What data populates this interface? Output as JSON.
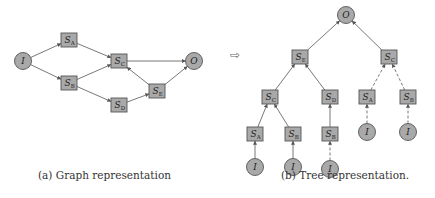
{
  "graph": {
    "caption": "(a) Graph representation",
    "nodes": [
      {
        "id": "I",
        "shape": "circle",
        "label": "I",
        "sub": "",
        "x": 23,
        "y": 61
      },
      {
        "id": "SA",
        "shape": "box",
        "label": "S",
        "sub": "A",
        "x": 69,
        "y": 40
      },
      {
        "id": "SB",
        "shape": "box",
        "label": "S",
        "sub": "B",
        "x": 69,
        "y": 83
      },
      {
        "id": "SC",
        "shape": "box",
        "label": "S",
        "sub": "C",
        "x": 119,
        "y": 61
      },
      {
        "id": "SD",
        "shape": "box",
        "label": "S",
        "sub": "D",
        "x": 119,
        "y": 105
      },
      {
        "id": "SE",
        "shape": "box",
        "label": "S",
        "sub": "E",
        "x": 157,
        "y": 91
      },
      {
        "id": "O",
        "shape": "circle",
        "label": "O",
        "sub": "",
        "x": 194,
        "y": 61
      }
    ],
    "edges": [
      {
        "from": "I",
        "to": "SA",
        "style": "solid"
      },
      {
        "from": "I",
        "to": "SB",
        "style": "solid"
      },
      {
        "from": "SA",
        "to": "SC",
        "style": "solid"
      },
      {
        "from": "SB",
        "to": "SC",
        "style": "solid"
      },
      {
        "from": "SB",
        "to": "SD",
        "style": "solid"
      },
      {
        "from": "SC",
        "to": "O",
        "style": "solid"
      },
      {
        "from": "SE",
        "to": "SC",
        "style": "solid"
      },
      {
        "from": "SD",
        "to": "SE",
        "style": "solid"
      },
      {
        "from": "SE",
        "to": "O",
        "style": "solid"
      }
    ]
  },
  "transform_arrow": "⇨",
  "tree": {
    "caption": "(b) Tree representation.",
    "nodes": [
      {
        "id": "t_O",
        "shape": "circle",
        "label": "O",
        "sub": "",
        "x": 346,
        "y": 15
      },
      {
        "id": "t_SE",
        "shape": "box",
        "label": "S",
        "sub": "E",
        "x": 300,
        "y": 57
      },
      {
        "id": "t_SC",
        "shape": "box",
        "label": "S",
        "sub": "C",
        "x": 389,
        "y": 57
      },
      {
        "id": "t_SC2",
        "shape": "box",
        "label": "S",
        "sub": "C",
        "x": 270,
        "y": 97
      },
      {
        "id": "t_SD",
        "shape": "box",
        "label": "S",
        "sub": "D",
        "x": 330,
        "y": 97
      },
      {
        "id": "t_SA2",
        "shape": "box",
        "label": "S",
        "sub": "A",
        "x": 367,
        "y": 97
      },
      {
        "id": "t_SB2",
        "shape": "box",
        "label": "S",
        "sub": "B",
        "x": 408,
        "y": 97
      },
      {
        "id": "t_SA3",
        "shape": "box",
        "label": "S",
        "sub": "A",
        "x": 255,
        "y": 134
      },
      {
        "id": "t_SB3",
        "shape": "box",
        "label": "S",
        "sub": "B",
        "x": 293,
        "y": 134
      },
      {
        "id": "t_SB4",
        "shape": "box",
        "label": "S",
        "sub": "B",
        "x": 330,
        "y": 134
      },
      {
        "id": "t_I1",
        "shape": "circle",
        "label": "I",
        "sub": "",
        "x": 255,
        "y": 167
      },
      {
        "id": "t_I2",
        "shape": "circle",
        "label": "I",
        "sub": "",
        "x": 293,
        "y": 167
      },
      {
        "id": "t_I3",
        "shape": "circle",
        "label": "I",
        "sub": "",
        "x": 330,
        "y": 169
      },
      {
        "id": "t_I4",
        "shape": "circle",
        "label": "I",
        "sub": "",
        "x": 367,
        "y": 132
      },
      {
        "id": "t_I5",
        "shape": "circle",
        "label": "I",
        "sub": "",
        "x": 408,
        "y": 132
      }
    ],
    "edges": [
      {
        "from": "t_SE",
        "to": "t_O",
        "style": "solid"
      },
      {
        "from": "t_SC",
        "to": "t_O",
        "style": "solid"
      },
      {
        "from": "t_SC2",
        "to": "t_SE",
        "style": "solid"
      },
      {
        "from": "t_SD",
        "to": "t_SE",
        "style": "solid"
      },
      {
        "from": "t_SA2",
        "to": "t_SC",
        "style": "dashed"
      },
      {
        "from": "t_SB2",
        "to": "t_SC",
        "style": "dashed"
      },
      {
        "from": "t_SA3",
        "to": "t_SC2",
        "style": "solid"
      },
      {
        "from": "t_SB3",
        "to": "t_SC2",
        "style": "solid"
      },
      {
        "from": "t_SB4",
        "to": "t_SD",
        "style": "solid"
      },
      {
        "from": "t_I1",
        "to": "t_SA3",
        "style": "solid"
      },
      {
        "from": "t_I2",
        "to": "t_SB3",
        "style": "solid"
      },
      {
        "from": "t_I3",
        "to": "t_SB4",
        "style": "dashed"
      },
      {
        "from": "t_I4",
        "to": "t_SA2",
        "style": "dashed"
      },
      {
        "from": "t_I5",
        "to": "t_SB2",
        "style": "dashed"
      }
    ]
  },
  "colors": {
    "node_fill": "#a9a9a9",
    "node_stroke": "#555555",
    "edge": "#555555",
    "text": "#222222"
  }
}
